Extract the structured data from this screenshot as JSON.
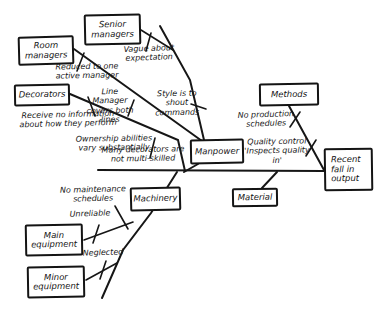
{
  "diagram": {
    "type": "fishbone-cause-effect",
    "effect": "Recent fall in output",
    "ink_color": "#161616",
    "paper_color": "#ffffff"
  },
  "boxes": {
    "senior": "Senior managers",
    "room": "Room managers",
    "decorators": "Decorators",
    "methods": "Methods",
    "manpower": "Manpower",
    "machinery": "Machinery",
    "material": "Material",
    "main_equipment": "Main equipment",
    "minor_equipment": "Minor equipment",
    "effect": "Recent fall in output"
  },
  "causes": {
    "vague": "Vague about expectation",
    "reduced": "Reduced to one active manager",
    "line_manager": "Line Manager covers both lines",
    "style": "Style is to shout commands",
    "receive": "Receive no information about how they perform",
    "ownership": "Ownership abilities vary substantially",
    "multi_skilled": "Many decorators are not multi-skilled",
    "no_production": "No production schedules",
    "quality": "Quality control 'Inspects quality in'",
    "no_maintenance": "No maintenance schedules",
    "unreliable": "Unreliable",
    "neglected": "Neglected"
  }
}
